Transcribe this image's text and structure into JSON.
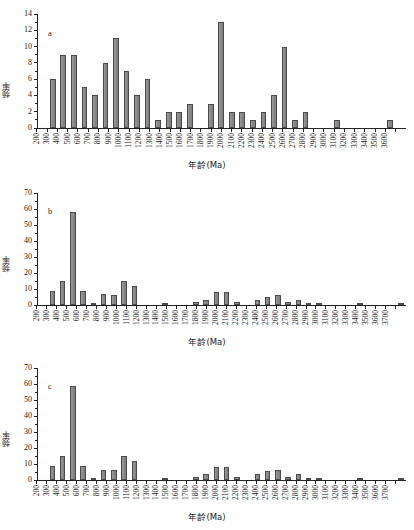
{
  "figure": {
    "axis_title_x": "年龄(Ma)",
    "axis_title_y": "频率"
  },
  "panels": [
    {
      "letter": "a",
      "id": "a"
    },
    {
      "letter": "b",
      "id": "b"
    },
    {
      "letter": "c",
      "id": "c"
    }
  ],
  "chart_data": [
    {
      "type": "bar",
      "title": "a",
      "xlabel": "年龄(Ma)",
      "ylabel": "频率",
      "ylim": [
        0,
        14
      ],
      "yticks": [
        0,
        2,
        4,
        6,
        8,
        10,
        12,
        14
      ],
      "grid": false,
      "legend": "none",
      "categories": [
        "200",
        "300",
        "400",
        "500",
        "600",
        "700",
        "800",
        "900",
        "1000",
        "1100",
        "1200",
        "1300",
        "1400",
        "1500",
        "1600",
        "1700",
        "1800",
        "1900",
        "2000",
        "2100",
        "2200",
        "2300",
        "2400",
        "2500",
        "2600",
        "2700",
        "2800",
        "2900",
        "3000",
        "3100",
        "3200",
        "3300",
        "3400",
        "3500",
        "3600"
      ],
      "values": [
        0,
        6,
        9,
        9,
        5,
        4,
        8,
        11,
        7,
        4,
        6,
        1,
        2,
        2,
        3,
        0,
        3,
        13,
        2,
        2,
        1,
        2,
        4,
        10,
        1,
        2,
        0,
        0,
        1,
        0,
        0,
        0,
        0,
        1,
        0
      ]
    },
    {
      "type": "bar",
      "title": "b",
      "xlabel": "年龄(Ma)",
      "ylabel": "频率",
      "ylim": [
        0,
        70
      ],
      "yticks": [
        0,
        10,
        20,
        30,
        40,
        50,
        60,
        70
      ],
      "grid": false,
      "legend": "none",
      "categories": [
        "200",
        "300",
        "400",
        "500",
        "600",
        "700",
        "800",
        "900",
        "1000",
        "1100",
        "1200",
        "1300",
        "1400",
        "1500",
        "1600",
        "1700",
        "1800",
        "1900",
        "2000",
        "2100",
        "2200",
        "2300",
        "2400",
        "2500",
        "2600",
        "2700",
        "2800",
        "2900",
        "3000",
        "3100",
        "3200",
        "3300",
        "3400",
        "3500",
        "3600",
        "3700"
      ],
      "values": [
        0,
        9,
        15,
        58,
        9,
        1,
        7,
        6,
        15,
        12,
        0,
        0,
        1,
        0,
        0,
        2,
        3,
        8,
        8,
        2,
        0,
        3,
        5,
        6.5,
        2,
        3,
        1,
        1,
        0,
        0,
        0,
        1,
        0,
        0,
        0,
        1
      ]
    },
    {
      "type": "bar",
      "title": "c",
      "xlabel": "年龄(Ma)",
      "ylabel": "频率",
      "ylim": [
        0,
        70
      ],
      "yticks": [
        0,
        10,
        20,
        30,
        40,
        50,
        60,
        70
      ],
      "grid": false,
      "legend": "none",
      "categories": [
        "200",
        "300",
        "400",
        "500",
        "600",
        "700",
        "800",
        "900",
        "1000",
        "1100",
        "1200",
        "1300",
        "1400",
        "1500",
        "1600",
        "1700",
        "1800",
        "1900",
        "2000",
        "2100",
        "2200",
        "2300",
        "2400",
        "2500",
        "2600",
        "2700",
        "2800",
        "2900",
        "3000",
        "3100",
        "3200",
        "3300",
        "3400",
        "3500",
        "3600",
        "3700"
      ],
      "values": [
        0,
        9,
        15,
        58.5,
        9,
        1,
        6.5,
        6,
        15,
        12,
        0,
        0,
        1,
        0,
        0,
        2,
        3.5,
        8,
        8,
        2,
        0,
        3.5,
        5.5,
        6.5,
        2,
        3.5,
        1,
        1,
        0,
        0,
        0,
        1,
        0,
        0,
        0,
        1.5
      ]
    }
  ],
  "colors": {
    "bar_fill": "#8e8e8e",
    "bar_stroke": "#4a4a4a",
    "axis": "#222222",
    "background": "#ffffff"
  }
}
